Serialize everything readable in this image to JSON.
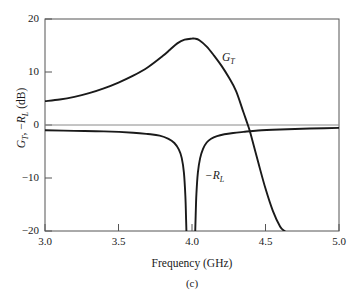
{
  "figure": {
    "caption": "(c)",
    "x_axis_title": "Frequency (GHz)",
    "y_axis_title_parts": {
      "g": "G",
      "g_sub": "T",
      "sep": ", −",
      "r": "R",
      "r_sub": "L",
      "unit": " (dB)"
    },
    "curve_labels": {
      "gt": {
        "main": "G",
        "sub": "T"
      },
      "rl": {
        "main": "−R",
        "sub": "L"
      }
    },
    "colors": {
      "curve": "#1a1a1a",
      "axis": "#4a4a4a",
      "background": "#ffffff"
    }
  },
  "chart_data": {
    "type": "line",
    "title": "",
    "subtitle": "(c)",
    "xlabel": "Frequency (GHz)",
    "ylabel": "G_T, -R_L (dB)",
    "xlim": [
      3.0,
      5.0
    ],
    "ylim": [
      -20,
      20
    ],
    "xticks": [
      3.0,
      3.5,
      4.0,
      4.5,
      5.0
    ],
    "xtick_labels": [
      "3.0",
      "3.5",
      "4.0",
      "4.5",
      "5.0"
    ],
    "yticks": [
      20,
      10,
      0,
      -10,
      -20
    ],
    "ytick_labels": [
      "20",
      "10",
      "0",
      "−10",
      "−20"
    ],
    "grid": false,
    "legend": "inline-annotations",
    "annotations": [
      {
        "text": "G_T",
        "x": 4.22,
        "y": 5.9
      },
      {
        "text": "-R_L",
        "x": 4.06,
        "y": -10.3
      }
    ],
    "series": [
      {
        "name": "G_T",
        "label": "G_T",
        "x": [
          3.0,
          3.1,
          3.2,
          3.3,
          3.4,
          3.5,
          3.6,
          3.7,
          3.8,
          3.85,
          3.9,
          3.95,
          4.0,
          4.02,
          4.05,
          4.1,
          4.15,
          4.2,
          4.25,
          4.3,
          4.35,
          4.38,
          4.4,
          4.45,
          4.5,
          4.55,
          4.6,
          4.63
        ],
        "y": [
          4.5,
          4.8,
          5.3,
          6.0,
          6.9,
          8.0,
          9.3,
          10.9,
          13.0,
          14.2,
          15.4,
          16.1,
          16.3,
          16.3,
          16.0,
          14.8,
          13.1,
          11.2,
          9.0,
          6.4,
          2.4,
          0.0,
          -1.8,
          -7.0,
          -12.0,
          -16.2,
          -19.2,
          -20.0
        ]
      },
      {
        "name": "-R_L",
        "label": "−R_L",
        "x": [
          3.0,
          3.2,
          3.4,
          3.6,
          3.7,
          3.78,
          3.84,
          3.88,
          3.91,
          3.93,
          3.945,
          3.955,
          3.96,
          3.962
        ],
        "y": [
          -1.0,
          -1.1,
          -1.2,
          -1.45,
          -1.7,
          -2.0,
          -2.6,
          -3.4,
          -4.6,
          -6.2,
          -9.0,
          -13.5,
          -18.0,
          -20.0
        ],
        "segment": "left-notch"
      },
      {
        "name": "-R_L",
        "label": "−R_L",
        "x": [
          4.022,
          4.025,
          4.03,
          4.04,
          4.055,
          4.075,
          4.1,
          4.13,
          4.17,
          4.22,
          4.28,
          4.35,
          4.45,
          4.6,
          4.75,
          4.9,
          5.0
        ],
        "y": [
          -20.0,
          -17.0,
          -13.0,
          -9.0,
          -6.3,
          -4.5,
          -3.3,
          -2.6,
          -2.1,
          -1.75,
          -1.5,
          -1.3,
          -1.05,
          -0.85,
          -0.7,
          -0.6,
          -0.55
        ],
        "segment": "right-notch"
      },
      {
        "name": "zero-line",
        "label": "0 dB reference",
        "x": [
          3.0,
          5.0
        ],
        "y": [
          0,
          0
        ],
        "style": "thin-gray"
      }
    ]
  },
  "axis_ticks": {
    "y": [
      {
        "label": "20",
        "value": 20
      },
      {
        "label": "10",
        "value": 10
      },
      {
        "label": "0",
        "value": 0
      },
      {
        "label": "−10",
        "value": -10
      },
      {
        "label": "−20",
        "value": -20
      }
    ],
    "x": [
      {
        "label": "3.0",
        "value": 3.0
      },
      {
        "label": "3.5",
        "value": 3.5
      },
      {
        "label": "4.0",
        "value": 4.0
      },
      {
        "label": "4.5",
        "value": 4.5
      },
      {
        "label": "5.0",
        "value": 5.0
      }
    ]
  }
}
